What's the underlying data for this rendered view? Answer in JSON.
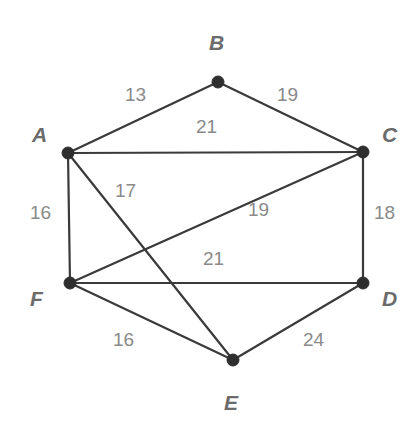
{
  "diagram": {
    "type": "weighted-undirected-graph",
    "title": "",
    "background_color": "#ffffff",
    "edge_color": "#3a3a3a",
    "vertex_color": "#2e2e2e",
    "vertex_label_color": "#6b6b6b",
    "weight_label_color": "#8a8a8a"
  },
  "chart_data": {
    "type": "diagram",
    "title": "",
    "nodes": [
      {
        "id": "A",
        "label": "A",
        "x": 68,
        "y": 153,
        "label_x": 32,
        "label_y": 124
      },
      {
        "id": "B",
        "label": "B",
        "x": 218,
        "y": 82,
        "label_x": 209,
        "label_y": 32
      },
      {
        "id": "C",
        "label": "C",
        "x": 363,
        "y": 152,
        "label_x": 382,
        "label_y": 124
      },
      {
        "id": "D",
        "label": "D",
        "x": 363,
        "y": 283,
        "label_x": 382,
        "label_y": 288
      },
      {
        "id": "E",
        "label": "E",
        "x": 233,
        "y": 360,
        "label_x": 224,
        "label_y": 392
      },
      {
        "id": "F",
        "label": "F",
        "x": 70,
        "y": 283,
        "label_x": 30,
        "label_y": 288
      }
    ],
    "edges": [
      {
        "from": "A",
        "to": "B",
        "weight": 13,
        "label_x": 125,
        "label_y": 85
      },
      {
        "from": "B",
        "to": "C",
        "weight": 19,
        "label_x": 277,
        "label_y": 85
      },
      {
        "from": "A",
        "to": "C",
        "weight": 21,
        "label_x": 196,
        "label_y": 117
      },
      {
        "from": "A",
        "to": "F",
        "weight": 16,
        "label_x": 30,
        "label_y": 203
      },
      {
        "from": "A",
        "to": "E",
        "weight": 17,
        "label_x": 115,
        "label_y": 181
      },
      {
        "from": "F",
        "to": "C",
        "weight": 19,
        "label_x": 248,
        "label_y": 200
      },
      {
        "from": "C",
        "to": "D",
        "weight": 18,
        "label_x": 374,
        "label_y": 203
      },
      {
        "from": "F",
        "to": "D",
        "weight": 21,
        "label_x": 203,
        "label_y": 249
      },
      {
        "from": "F",
        "to": "E",
        "weight": 16,
        "label_x": 113,
        "label_y": 330
      },
      {
        "from": "D",
        "to": "E",
        "weight": 24,
        "label_x": 303,
        "label_y": 330
      }
    ],
    "node_radius": 6,
    "edge_weights_sum": 184,
    "node_count": 6,
    "edge_count": 10
  }
}
